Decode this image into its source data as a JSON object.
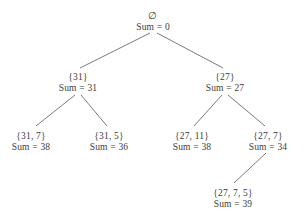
{
  "diagram": {
    "line_color": "#6b6b6b",
    "text_color": "#3c3c3c",
    "background_color": "#ffffff",
    "nodes": [
      {
        "id": "root",
        "set": "∅",
        "sum": "Sum = 0",
        "x": 153,
        "y": 10
      },
      {
        "id": "n31",
        "set": "{31}",
        "sum": "Sum = 31",
        "x": 78,
        "y": 72
      },
      {
        "id": "n27",
        "set": "{27}",
        "sum": "Sum = 27",
        "x": 225,
        "y": 72
      },
      {
        "id": "n31_7",
        "set": "{31, 7}",
        "sum": "Sum = 38",
        "x": 31,
        "y": 131
      },
      {
        "id": "n31_5",
        "set": "{31, 5}",
        "sum": "Sum = 36",
        "x": 109,
        "y": 131
      },
      {
        "id": "n27_11",
        "set": "{27, 11}",
        "sum": "Sum = 38",
        "x": 192,
        "y": 131
      },
      {
        "id": "n27_7",
        "set": "{27, 7}",
        "sum": "Sum = 34",
        "x": 268,
        "y": 131
      },
      {
        "id": "n27_7_5",
        "set": "{27, 7, 5}",
        "sum": "Sum = 39",
        "x": 233,
        "y": 188
      }
    ],
    "edges": [
      {
        "id": "root-to-31",
        "x1": 150,
        "y1": 33,
        "x2": 80,
        "y2": 68
      },
      {
        "id": "root-to-27",
        "x1": 157,
        "y1": 33,
        "x2": 223,
        "y2": 68
      },
      {
        "id": "n31-to-31_7",
        "x1": 75,
        "y1": 95,
        "x2": 36,
        "y2": 126
      },
      {
        "id": "n31-to-31_5",
        "x1": 81,
        "y1": 95,
        "x2": 107,
        "y2": 126
      },
      {
        "id": "n27-to-27_11",
        "x1": 222,
        "y1": 95,
        "x2": 194,
        "y2": 126
      },
      {
        "id": "n27-to-27_7",
        "x1": 228,
        "y1": 95,
        "x2": 265,
        "y2": 126
      },
      {
        "id": "n27_7-to-27_7_5",
        "x1": 266,
        "y1": 153,
        "x2": 234,
        "y2": 183
      }
    ]
  }
}
